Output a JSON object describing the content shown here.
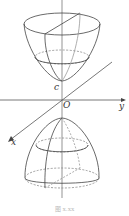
{
  "figure": {
    "caption": "图 x.xx",
    "axes": {
      "x_label": "x",
      "y_label": "y",
      "origin_label": "O",
      "vertex_label": "c"
    }
  }
}
